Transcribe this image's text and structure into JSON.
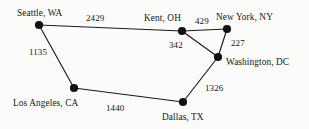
{
  "diagram": {
    "background_color": "#fbfbf9",
    "line_color": "#1a1a1a",
    "node_color": "#111111",
    "text_color": "#171717",
    "nodes": [
      {
        "id": "seattle",
        "label": "Seattle, WA",
        "x": 39,
        "y": 25
      },
      {
        "id": "kent",
        "label": "Kent, OH",
        "x": 182,
        "y": 31
      },
      {
        "id": "newyork",
        "label": "New York, NY",
        "x": 227,
        "y": 29
      },
      {
        "id": "washington",
        "label": "Washington, DC",
        "x": 218,
        "y": 57
      },
      {
        "id": "losangeles",
        "label": "Los Angeles, CA",
        "x": 74,
        "y": 88
      },
      {
        "id": "dallas",
        "label": "Dallas, TX",
        "x": 183,
        "y": 102
      }
    ],
    "edges": [
      {
        "from": "seattle",
        "to": "kent",
        "weight": "2429"
      },
      {
        "from": "kent",
        "to": "newyork",
        "weight": "429"
      },
      {
        "from": "kent",
        "to": "washington",
        "weight": "342"
      },
      {
        "from": "newyork",
        "to": "washington",
        "weight": "227"
      },
      {
        "from": "seattle",
        "to": "losangeles",
        "weight": "1135"
      },
      {
        "from": "losangeles",
        "to": "dallas",
        "weight": "1440"
      },
      {
        "from": "dallas",
        "to": "washington",
        "weight": "1326"
      }
    ],
    "city_labels": [
      {
        "name": "seattle",
        "text": "Seattle, WA",
        "x": 17,
        "y": 9
      },
      {
        "name": "kent",
        "text": "Kent, OH",
        "x": 144,
        "y": 14
      },
      {
        "name": "newyork",
        "text": "New York, NY",
        "x": 216,
        "y": 13
      },
      {
        "name": "washington",
        "text": "Washington, DC",
        "x": 226,
        "y": 58
      },
      {
        "name": "losangeles",
        "text": "Los Angeles, CA",
        "x": 13,
        "y": 99
      },
      {
        "name": "dallas",
        "text": "Dallas, TX",
        "x": 162,
        "y": 113
      }
    ],
    "weight_labels": [
      {
        "name": "seattle-kent",
        "text": "2429",
        "x": 86,
        "y": 14
      },
      {
        "name": "kent-newyork",
        "text": "429",
        "x": 195,
        "y": 17
      },
      {
        "name": "newyork-washington",
        "text": "227",
        "x": 231,
        "y": 39
      },
      {
        "name": "kent-washington",
        "text": "342",
        "x": 169,
        "y": 41
      },
      {
        "name": "seattle-losangeles",
        "text": "1135",
        "x": 29,
        "y": 48
      },
      {
        "name": "dallas-washington",
        "text": "1326",
        "x": 205,
        "y": 84
      },
      {
        "name": "losangeles-dallas",
        "text": "1440",
        "x": 106,
        "y": 104
      }
    ]
  }
}
